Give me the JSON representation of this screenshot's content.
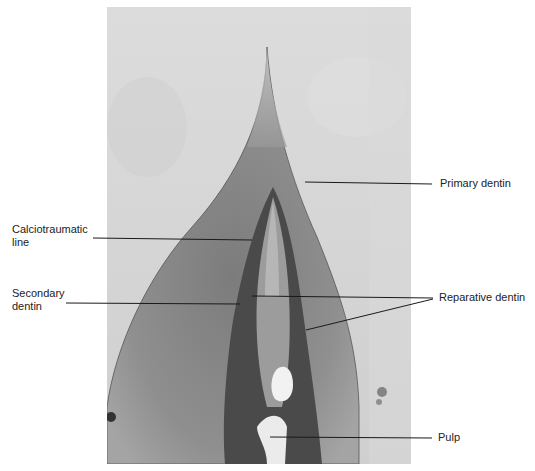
{
  "figure": {
    "type": "histological micrograph"
  },
  "labels": {
    "primary_dentin": "Primary dentin",
    "calciotraumatic_line_1": "Calciotraumatic",
    "calciotraumatic_line_2": "line",
    "secondary_dentin_1": "Secondary",
    "secondary_dentin_2": "dentin",
    "reparative_dentin": "Reparative dentin",
    "pulp": "Pulp"
  },
  "colors": {
    "background": "#ffffff",
    "photo_background": "#d6d6d6",
    "dentin": "#8e8e8e",
    "pulp_dark": "#3a3a3a",
    "leader_line": "#1a1a1a",
    "label_text": "#222222"
  }
}
